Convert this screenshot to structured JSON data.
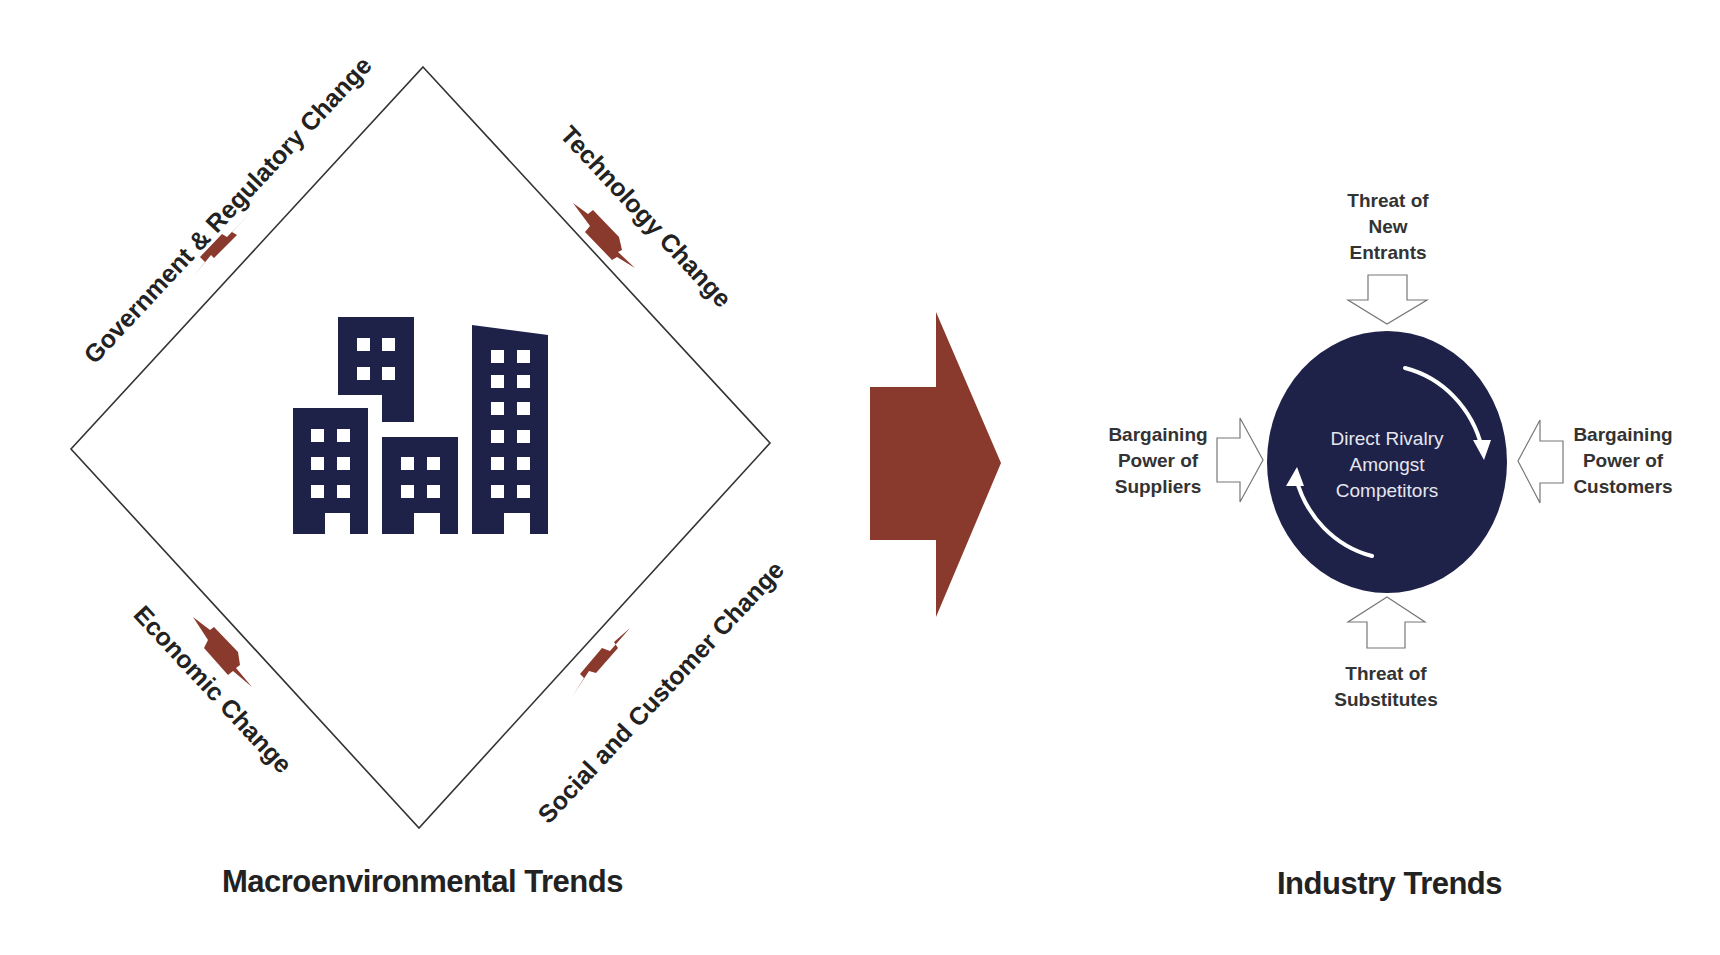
{
  "colors": {
    "accent_rust": "#8a3a2c",
    "navy": "#1e2148",
    "outline": "#333333",
    "arrow_outline": "#777777",
    "background": "#ffffff"
  },
  "macro": {
    "title": "Macroenvironmental Trends",
    "icon": "city-buildings-icon",
    "labels": {
      "top_left": "Government & Regulatory Change",
      "top_right": "Technology Change",
      "bottom_left": "Economic Change",
      "bottom_right": "Social and Customer Change"
    }
  },
  "transition": {
    "icon": "large-right-arrow-icon"
  },
  "industry": {
    "title": "Industry Trends",
    "core": {
      "line1": "Direct Rivalry",
      "line2": "Amongst",
      "line3": "Competitors",
      "icon": "cycle-arrows-icon"
    },
    "forces": {
      "top": {
        "line1": "Threat of",
        "line2": "New",
        "line3": "Entrants"
      },
      "left": {
        "line1": "Bargaining",
        "line2": "Power of",
        "line3": "Suppliers"
      },
      "right": {
        "line1": "Bargaining",
        "line2": "Power of",
        "line3": "Customers"
      },
      "bottom": {
        "line1": "Threat of",
        "line2": "Substitutes"
      }
    }
  }
}
